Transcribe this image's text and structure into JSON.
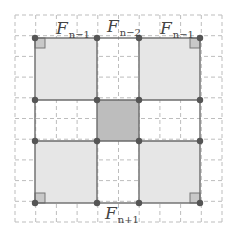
{
  "diagram": {
    "grid": {
      "origin": 15,
      "spacing": 20.7,
      "cells": 10,
      "color": "#bdbdbd"
    },
    "outer_square": {
      "x1": 35,
      "y1": 38,
      "x2": 200,
      "y2": 203
    },
    "inner_lines": {
      "xs": [
        97,
        139
      ],
      "ys": [
        100,
        141
      ]
    },
    "colors": {
      "corner_fill": "#e6e6e6",
      "center_fill": "#bdbdbd",
      "edge": "#6b6b6b",
      "dot": "#555555",
      "right_angle_fill": "#c8c8c8"
    },
    "labels": {
      "top_left": {
        "base": "F",
        "sub": "n−1"
      },
      "top_middle": {
        "base": "F",
        "sub": "n−2"
      },
      "top_right": {
        "base": "F",
        "sub": "n−1"
      },
      "bottom_middle": {
        "base": "F",
        "sub": "n+1"
      }
    },
    "regions": [
      "top-left square F_{n-1}",
      "top-right square F_{n-1}",
      "bottom-left square F_{n-1}",
      "bottom-right square F_{n-1}",
      "center square",
      "cross rectangles"
    ]
  }
}
